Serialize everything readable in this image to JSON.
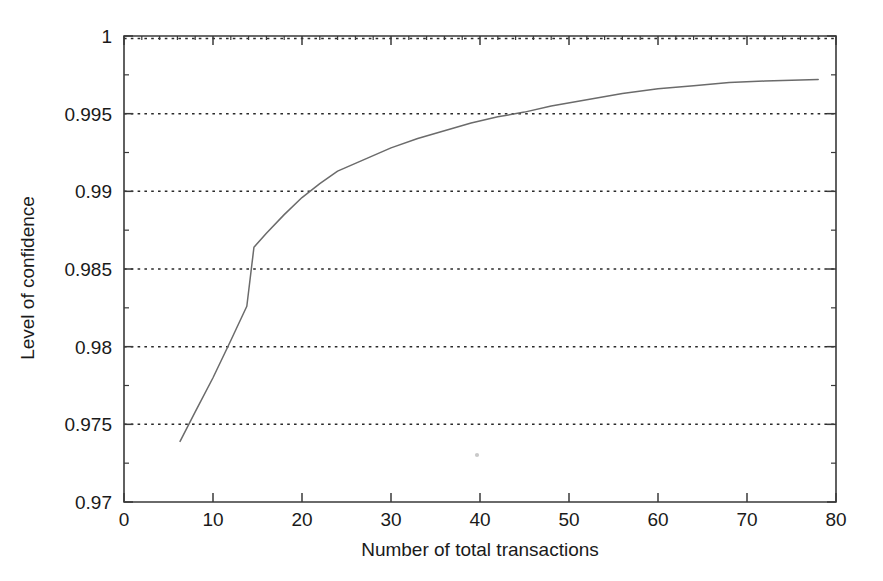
{
  "chart_data": {
    "type": "line",
    "title": "",
    "subtitle": "",
    "xlabel": "Number of total transactions",
    "ylabel": "Level of confidence",
    "xlim": [
      0,
      80
    ],
    "ylim": [
      0.97,
      1
    ],
    "grid": "horizontal-dotted",
    "legend": "none",
    "x_ticks": [
      "0",
      "10",
      "20",
      "30",
      "40",
      "50",
      "60",
      "70",
      "80"
    ],
    "x_tick_values": [
      0,
      10,
      20,
      30,
      40,
      50,
      60,
      70,
      80
    ],
    "y_ticks": [
      "0.97",
      "0.975",
      "0.98",
      "0.985",
      "0.99",
      "0.995",
      "1"
    ],
    "y_tick_values": [
      0.97,
      0.975,
      0.98,
      0.985,
      0.99,
      0.995,
      1
    ],
    "series": [
      {
        "name": "Level of confidence",
        "color": "#6b6b6b",
        "x": [
          6.3,
          8.0,
          10.0,
          12.0,
          13.8,
          14.6,
          16.0,
          18.0,
          20.0,
          22.0,
          24.0,
          26.0,
          28.0,
          30.0,
          33.0,
          36.0,
          39.0,
          42.0,
          45.0,
          48.0,
          52.0,
          56.0,
          60.0,
          64.0,
          68.0,
          72.0,
          75.0,
          78.0
        ],
        "y": [
          0.9739,
          0.9758,
          0.978,
          0.9804,
          0.9826,
          0.9864,
          0.9873,
          0.9885,
          0.9896,
          0.9905,
          0.9913,
          0.9918,
          0.9923,
          0.9928,
          0.9934,
          0.9939,
          0.9944,
          0.9948,
          0.9951,
          0.9955,
          0.9959,
          0.9963,
          0.9966,
          0.9968,
          0.997,
          0.9971,
          0.99715,
          0.9972
        ]
      }
    ]
  },
  "axes": {
    "x_title": "Number of total transactions",
    "y_title": "Level of confidence"
  }
}
